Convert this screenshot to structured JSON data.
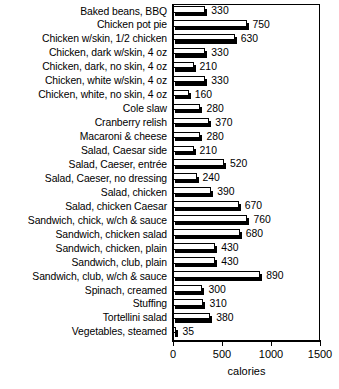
{
  "chart_data": {
    "type": "bar",
    "orientation": "horizontal",
    "title": "",
    "subtitle": "",
    "xlabel": "calories",
    "ylabel": "",
    "xlim": [
      0,
      1500
    ],
    "xticks": [
      0,
      500,
      1000,
      1500
    ],
    "xtick_labels": [
      "0",
      "500",
      "1000",
      "1500"
    ],
    "grid": false,
    "legend": null,
    "value_labels_shown": true,
    "categories": [
      "Baked beans, BBQ",
      "Chicken pot pie",
      "Chicken w/skin, 1/2 chicken",
      "Chicken, dark w/skin, 4 oz",
      "Chicken, dark, no skin, 4 oz",
      "Chicken, white w/skin, 4 oz",
      "Chicken, white, no skin, 4 oz",
      "Cole slaw",
      "Cranberry relish",
      "Macaroni & cheese",
      "Salad, Caesar side",
      "Salad, Caeser, entrée",
      "Salad, Caeser, no dressing",
      "Salad, chicken",
      "Salad, chicken Caesar",
      "Sandwich, chick, w/ch & sauce",
      "Sandwich, chicken salad",
      "Sandwich, chicken, plain",
      "Sandwich, club, plain",
      "Sandwich, club, w/ch & sauce",
      "Spinach, creamed",
      "Stuffing",
      "Tortellini salad",
      "Vegetables, steamed"
    ],
    "values": [
      330,
      750,
      630,
      330,
      210,
      330,
      160,
      280,
      370,
      280,
      210,
      520,
      240,
      390,
      670,
      760,
      680,
      430,
      430,
      890,
      300,
      310,
      380,
      35
    ],
    "value_text": [
      "330",
      "750",
      "630",
      "330",
      "210",
      "330",
      "160",
      "280",
      "370",
      "280",
      "210",
      "520",
      "240",
      "390",
      "670",
      "760",
      "680",
      "430",
      "430",
      "890",
      "300",
      "310",
      "380",
      "35"
    ]
  },
  "style": {
    "bar_face_color": "#ffffff",
    "bar_edge_color": "#000000",
    "bar_shadow_color": "#000000",
    "background": "#ffffff",
    "text_color": "#000000"
  }
}
